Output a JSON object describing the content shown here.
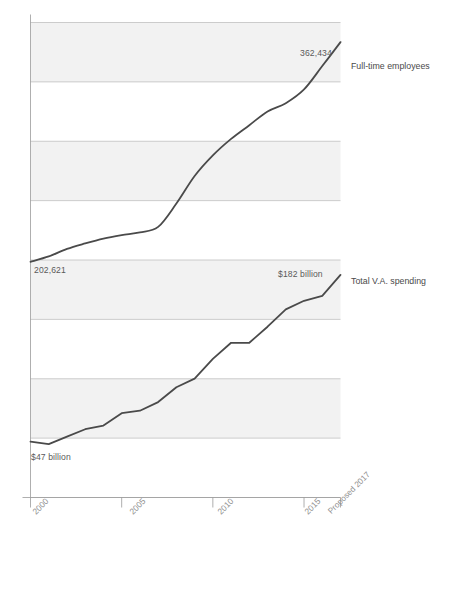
{
  "chart_data": {
    "type": "line",
    "title": "",
    "subtitle": "",
    "xlabel": "",
    "ylabel": "",
    "grid": true,
    "legend_position": "right-inline",
    "x_ticks": [
      {
        "label": "2000",
        "x": 2000
      },
      {
        "label": "2005",
        "x": 2005
      },
      {
        "label": "2010",
        "x": 2010
      },
      {
        "label": "2015",
        "x": 2015
      },
      {
        "label": "Proposed 2017",
        "x": 2017
      }
    ],
    "xlim": [
      2000,
      2017
    ],
    "series": [
      {
        "name": "Full-time employees",
        "units": "employees",
        "color": "#4a4a4a",
        "start_label": "202,621",
        "end_label": "362,434",
        "x": [
          2000,
          2001,
          2002,
          2003,
          2004,
          2005,
          2006,
          2007,
          2008,
          2009,
          2010,
          2011,
          2012,
          2013,
          2014,
          2015,
          2016,
          2017
        ],
        "values": [
          202621,
          206500,
          212000,
          216000,
          219500,
          222000,
          224000,
          228000,
          245000,
          265000,
          280000,
          292000,
          302000,
          312000,
          318000,
          328000,
          345000,
          362434
        ]
      },
      {
        "name": "Total V.A. spending",
        "units": "billions of dollars",
        "color": "#4a4a4a",
        "start_label": "$47 billion",
        "end_label": "$182 billion",
        "x": [
          2000,
          2001,
          2002,
          2003,
          2004,
          2005,
          2006,
          2007,
          2008,
          2009,
          2010,
          2011,
          2012,
          2013,
          2014,
          2015,
          2016,
          2017
        ],
        "values": [
          47,
          45,
          51,
          57,
          60,
          70,
          72,
          79,
          91,
          98,
          114,
          127,
          127,
          140,
          154,
          161,
          165,
          182
        ]
      }
    ],
    "annotations": [
      {
        "id": "employees-end",
        "text": "362,434"
      },
      {
        "id": "employees-start",
        "text": "202,621"
      },
      {
        "id": "spending-end",
        "text": "$182 billion"
      },
      {
        "id": "spending-start",
        "text": "$47 billion"
      }
    ],
    "style": {
      "band_color": "#f2f2f2",
      "band_alt_color": "#ffffff",
      "gridline_color": "#b9b9b9",
      "axis_color": "#9a9a9a",
      "line_color": "#4a4a4a",
      "line_width": 1.8
    }
  },
  "labels": {
    "employees_series": "Full-time employees",
    "spending_series": "Total V.A. spending",
    "employees_end": "362,434",
    "employees_start": "202,621",
    "spending_end": "$182 billion",
    "spending_start": "$47 billion",
    "tick_2000": "2000",
    "tick_2005": "2005",
    "tick_2010": "2010",
    "tick_2015": "2015",
    "tick_2017": "Proposed 2017"
  }
}
